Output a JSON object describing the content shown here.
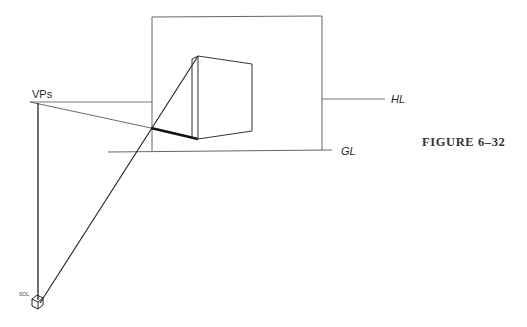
{
  "figure": {
    "caption": "FIGURE 6–32",
    "labels": {
      "vanishing_point": "VPs",
      "horizon_line": "HL",
      "ground_line": "GL",
      "station_point": "SOL"
    }
  },
  "colors": {
    "ink": "#2a2a2a",
    "thin_line": "#555555",
    "background": "#ffffff"
  }
}
